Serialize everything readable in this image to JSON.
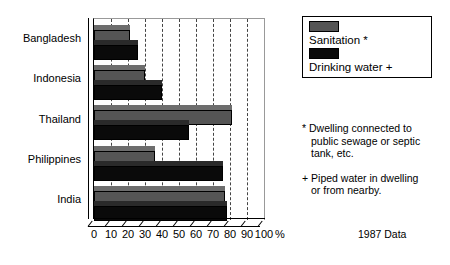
{
  "chart_data": {
    "type": "bar",
    "orientation": "horizontal",
    "title": "",
    "xlabel": "%",
    "ylabel": "",
    "xlim": [
      0,
      100
    ],
    "xticks": [
      0,
      10,
      20,
      30,
      40,
      50,
      60,
      70,
      80,
      90,
      100
    ],
    "grid": true,
    "legend_position": "top-right",
    "categories": [
      "Bangladesh",
      "Indonesia",
      "Thailand",
      "Philippines",
      "India"
    ],
    "series": [
      {
        "name": "Sanitation *",
        "color": "#555555",
        "values": [
          21,
          30,
          81,
          36,
          77
        ]
      },
      {
        "name": "Drinking water +",
        "color": "#0a0a0a",
        "values": [
          26,
          40,
          56,
          76,
          78
        ]
      }
    ],
    "annotations": [
      "* Dwelling connected to public sewage or septic tank, etc.",
      "+ Piped water in dwelling or from nearby.",
      "1987 Data"
    ]
  },
  "axis": {
    "unit_label": "%",
    "tick_labels": [
      "0",
      "10",
      "20",
      "30",
      "40",
      "50",
      "60",
      "70",
      "80",
      "90",
      "100"
    ],
    "category_labels": [
      "Bangladesh",
      "Indonesia",
      "Thailand",
      "Philippines",
      "India"
    ]
  },
  "legend": {
    "items": [
      {
        "label": "Sanitation *",
        "swatch": "sanitation-swatch"
      },
      {
        "label": "Drinking water +",
        "swatch": "drinking-water-swatch"
      }
    ]
  },
  "notes": {
    "sanitation_note_line1": "* Dwelling connected to",
    "sanitation_note_line2": "public sewage or septic",
    "sanitation_note_line3": "tank, etc.",
    "water_note_line1": "+ Piped water in dwelling",
    "water_note_line2": "or from nearby.",
    "data_year": "1987 Data"
  }
}
